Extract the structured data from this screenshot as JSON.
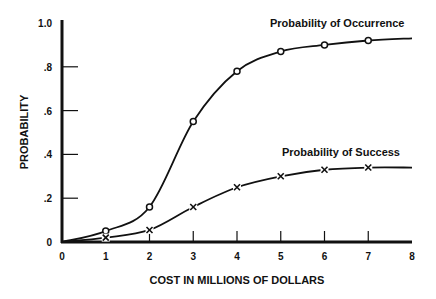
{
  "chart_data": {
    "type": "line",
    "title": "",
    "xlabel": "COST IN MILLIONS OF DOLLARS",
    "ylabel": "PROBABILITY",
    "xlim": [
      0,
      8
    ],
    "ylim": [
      0,
      1.0
    ],
    "x_ticks": [
      "0",
      "1",
      "2",
      "3",
      "4",
      "5",
      "6",
      "7",
      "8"
    ],
    "y_ticks": [
      "0",
      ".2",
      ".4",
      ".6",
      ".8",
      "1.0"
    ],
    "grid": false,
    "legend": "inline labels",
    "series": [
      {
        "name": "Probability of Occurrence",
        "marker": "o",
        "x": [
          1,
          2,
          3,
          4,
          5,
          6,
          7
        ],
        "values": [
          0.05,
          0.16,
          0.55,
          0.78,
          0.87,
          0.9,
          0.92
        ],
        "curve_end": [
          8,
          0.93
        ]
      },
      {
        "name": "Probability of Success",
        "marker": "x",
        "x": [
          1,
          2,
          3,
          4,
          5,
          6,
          7
        ],
        "values": [
          0.02,
          0.055,
          0.16,
          0.25,
          0.3,
          0.33,
          0.34
        ],
        "curve_end": [
          8,
          0.34
        ]
      }
    ]
  },
  "labels": {
    "xlabel": "COST IN MILLIONS OF DOLLARS",
    "ylabel": "PROBABILITY",
    "series0": "Probability of Occurrence",
    "series1": "Probability of Success"
  }
}
